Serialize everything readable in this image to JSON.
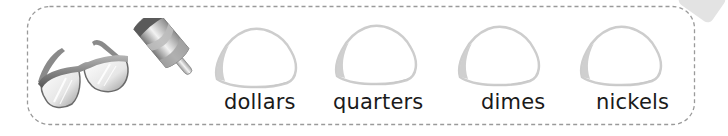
{
  "worksheet": {
    "pictures": [
      {
        "name": "sunglasses"
      },
      {
        "name": "ice-pop"
      }
    ],
    "sort_bins": [
      {
        "label": "dollars"
      },
      {
        "label": "quarters"
      },
      {
        "label": "dimes"
      },
      {
        "label": "nickels"
      }
    ]
  },
  "colors": {
    "border": "#9a9a9a",
    "mound_outline": "#c8c8c8",
    "label_text": "#1a1a1a"
  }
}
